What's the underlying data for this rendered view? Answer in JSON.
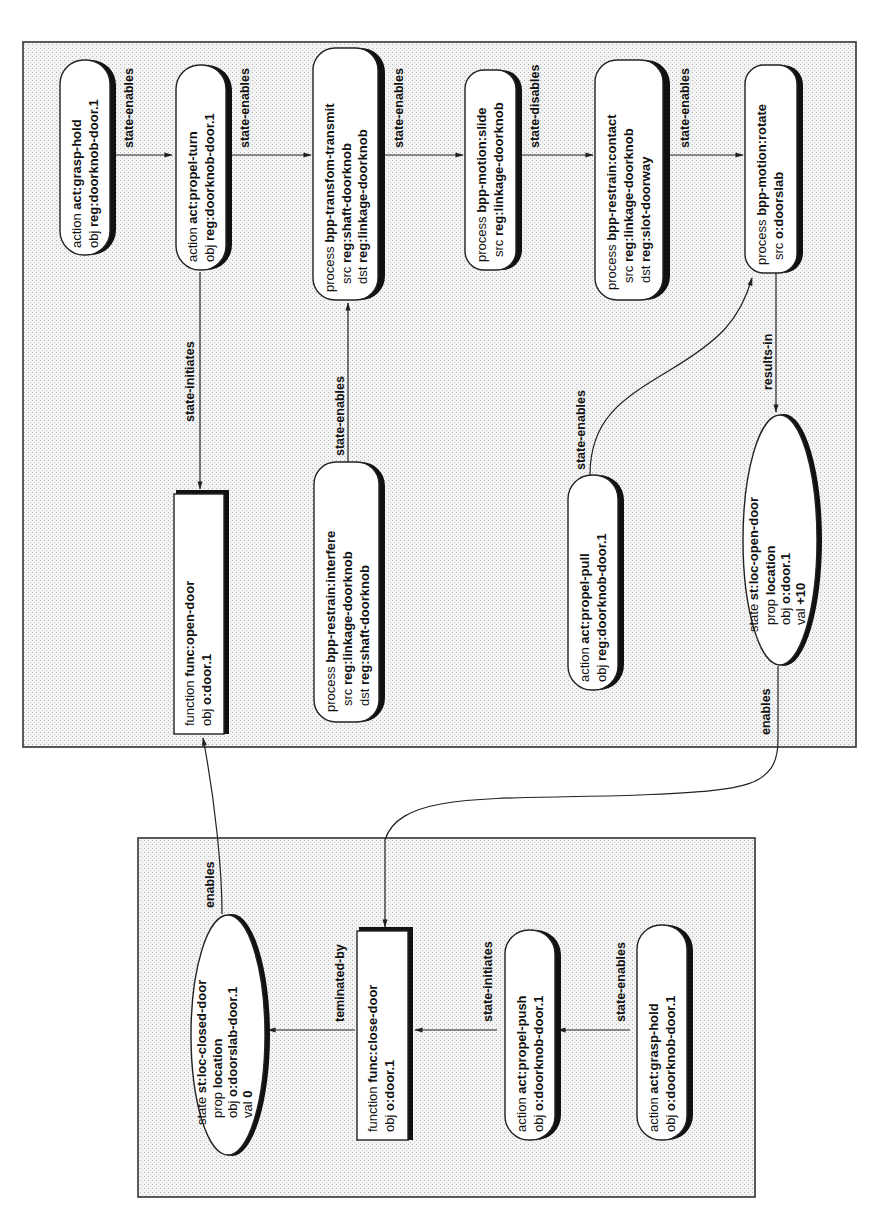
{
  "diagram": {
    "frames": [
      {
        "id": "open-door-frame",
        "label": "open-door functional model"
      },
      {
        "id": "close-door-frame",
        "label": "close-door functional model"
      }
    ],
    "nodes": {
      "n1": {
        "type": "action",
        "kind": "action",
        "name": "act:grasp-hold",
        "rows": [
          {
            "k": "obj",
            "v": "reg:doorknob-door.1"
          }
        ]
      },
      "n2": {
        "type": "action",
        "kind": "action",
        "name": "act:propel-turn",
        "rows": [
          {
            "k": "obj",
            "v": "reg:doorknob-door.1"
          }
        ]
      },
      "n3": {
        "type": "process",
        "kind": "process",
        "name": "bpp-transfom-transmit",
        "rows": [
          {
            "k": "src",
            "v": "reg:shaft-doorknob"
          },
          {
            "k": "dst",
            "v": "reg:linkage-doorknob"
          }
        ]
      },
      "n4": {
        "type": "process",
        "kind": "process",
        "name": "bpp-motion:slide",
        "rows": [
          {
            "k": "src",
            "v": "reg:linkage-doorknob"
          }
        ]
      },
      "n5": {
        "type": "process",
        "kind": "process",
        "name": "bpp-restrain:contact",
        "rows": [
          {
            "k": "src",
            "v": "reg:linkage-doorknob"
          },
          {
            "k": "dst",
            "v": "reg:slot-doorway"
          }
        ]
      },
      "n6": {
        "type": "process",
        "kind": "process",
        "name": "bpp-motion:rotate",
        "rows": [
          {
            "k": "src",
            "v": "o:doorslab"
          }
        ]
      },
      "n7": {
        "type": "function",
        "kind": "function",
        "name": "func:open-door",
        "rows": [
          {
            "k": "obj",
            "v": "o:door.1"
          }
        ]
      },
      "n8": {
        "type": "process",
        "kind": "process",
        "name": "bpp-restrain:interfere",
        "rows": [
          {
            "k": "src",
            "v": "reg:linkage-doorknob"
          },
          {
            "k": "dst",
            "v": "reg:shaft-doorknob"
          }
        ]
      },
      "n9": {
        "type": "action",
        "kind": "action",
        "name": "act:propel-pull",
        "rows": [
          {
            "k": "obj",
            "v": "reg:doorknob-door.1"
          }
        ]
      },
      "n10": {
        "type": "state",
        "kind": "state",
        "name": "st:loc-open-door",
        "rows": [
          {
            "k": "prop",
            "v": "location"
          },
          {
            "k": "obj",
            "v": "o:door.1"
          },
          {
            "k": "val",
            "v": "+10"
          }
        ]
      },
      "n11": {
        "type": "state",
        "kind": "state",
        "name": "st:loc-closed-door",
        "rows": [
          {
            "k": "prop",
            "v": "location"
          },
          {
            "k": "obj",
            "v": "o:doorslab-door.1"
          },
          {
            "k": "val",
            "v": "0"
          }
        ]
      },
      "n12": {
        "type": "function",
        "kind": "function",
        "name": "func:close-door",
        "rows": [
          {
            "k": "obj",
            "v": "o:door.1"
          }
        ]
      },
      "n13": {
        "type": "action",
        "kind": "action",
        "name": "act:propel-push",
        "rows": [
          {
            "k": "obj",
            "v": "o:doorknob-door.1"
          }
        ]
      },
      "n14": {
        "type": "action",
        "kind": "action",
        "name": "act:grasp-hold",
        "rows": [
          {
            "k": "obj",
            "v": "o:doorknob-door.1"
          }
        ]
      }
    },
    "edges": {
      "e1": {
        "from": "n1",
        "to": "n2",
        "label": "state-enables"
      },
      "e2": {
        "from": "n2",
        "to": "n3",
        "label": "state-enables"
      },
      "e3": {
        "from": "n3",
        "to": "n4",
        "label": "state-enables"
      },
      "e4": {
        "from": "n4",
        "to": "n5",
        "label": "state-disables"
      },
      "e5": {
        "from": "n5",
        "to": "n6",
        "label": "state-enables"
      },
      "e6": {
        "from": "n2",
        "to": "n7",
        "label": "state-initiates"
      },
      "e7": {
        "from": "n8",
        "to": "n3",
        "label": "state-enables"
      },
      "e8": {
        "from": "n9",
        "to": "n6",
        "label": "state-enables"
      },
      "e9": {
        "from": "n6",
        "to": "n10",
        "label": "results-in"
      },
      "e10": {
        "from": "n10",
        "to": "n12",
        "label": "enables"
      },
      "e11": {
        "from": "n11",
        "to": "n7",
        "label": "enables"
      },
      "e12": {
        "from": "n12",
        "to": "n11",
        "label": "teminated-by"
      },
      "e13": {
        "from": "n13",
        "to": "n12",
        "label": "state-initiates"
      },
      "e14": {
        "from": "n14",
        "to": "n13",
        "label": "state-enables"
      }
    }
  }
}
